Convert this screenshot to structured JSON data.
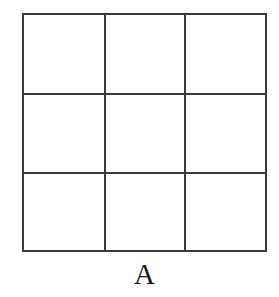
{
  "figure": {
    "kind": "geometric-grid-figure",
    "caption": "A",
    "background_color": "#ffffff",
    "line_color": "#3a3a3a",
    "caption_color": "#171717",
    "grid": {
      "rows": 3,
      "columns": 3,
      "cell_fill": "#ffffff",
      "cells": [
        {
          "id": "r1c1",
          "row": 1,
          "column": 1,
          "label": ""
        },
        {
          "id": "r1c2",
          "row": 1,
          "column": 2,
          "label": ""
        },
        {
          "id": "r1c3",
          "row": 1,
          "column": 3,
          "label": ""
        },
        {
          "id": "r2c1",
          "row": 2,
          "column": 1,
          "label": ""
        },
        {
          "id": "r2c2",
          "row": 2,
          "column": 2,
          "label": ""
        },
        {
          "id": "r2c3",
          "row": 2,
          "column": 3,
          "label": ""
        },
        {
          "id": "r3c1",
          "row": 3,
          "column": 1,
          "label": ""
        },
        {
          "id": "r3c2",
          "row": 3,
          "column": 2,
          "label": ""
        },
        {
          "id": "r3c3",
          "row": 3,
          "column": 3,
          "label": ""
        }
      ],
      "column_edges": [
        0,
        83,
        163,
        245
      ],
      "row_edges": [
        0,
        81,
        160,
        239
      ]
    }
  }
}
